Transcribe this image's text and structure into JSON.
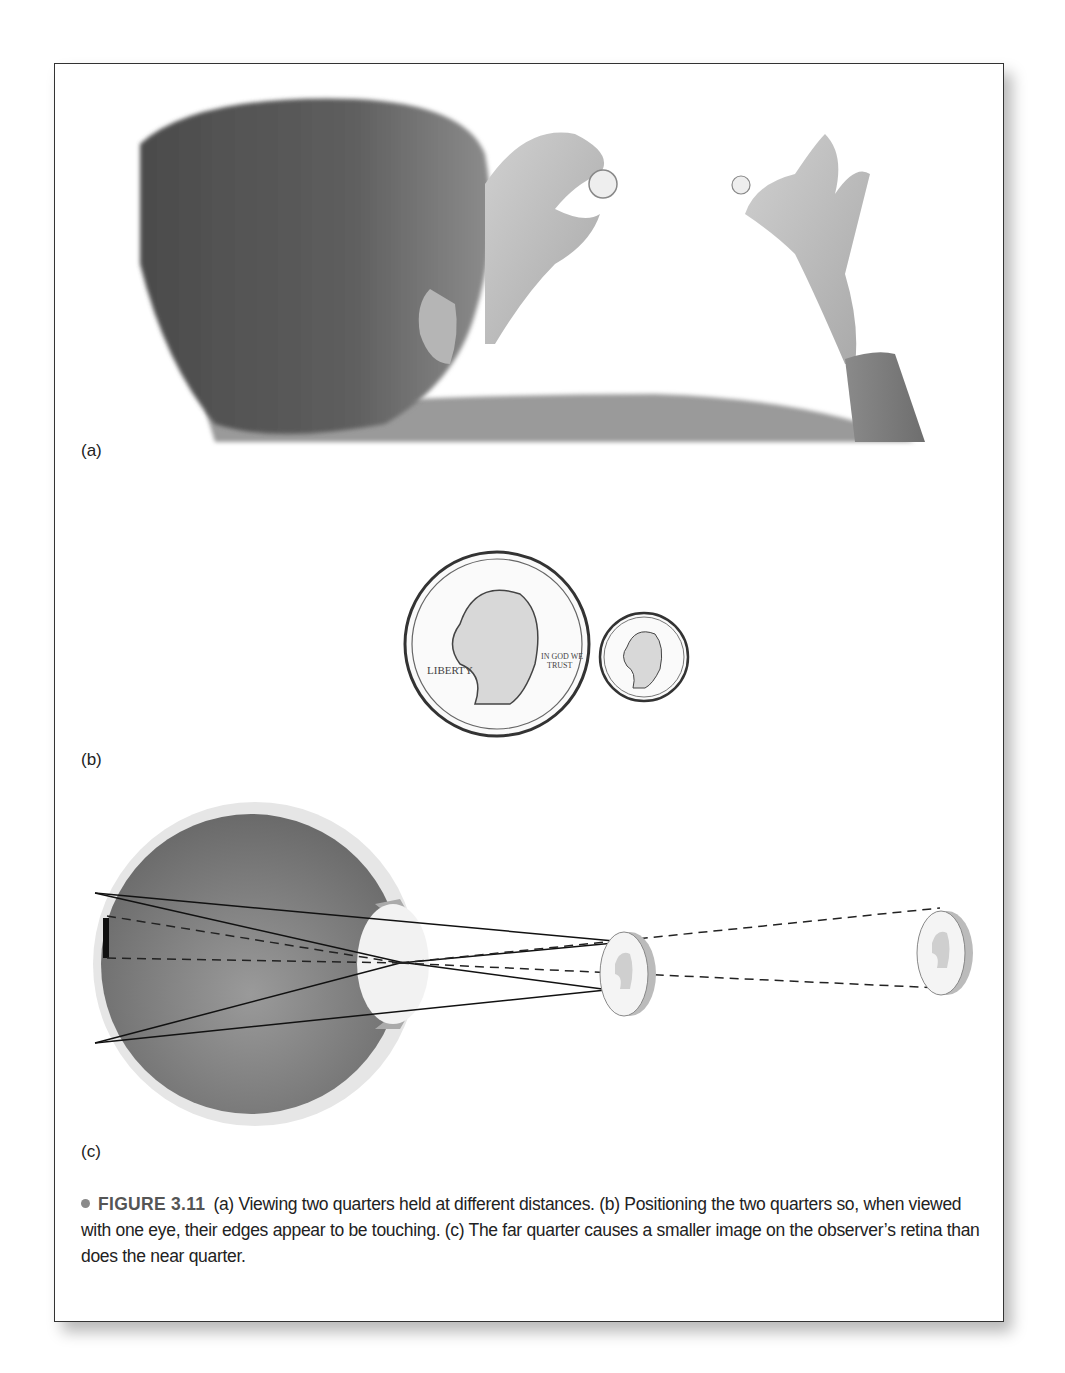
{
  "figure": {
    "panels": [
      {
        "id": "a",
        "label": "(a)",
        "content": "Back of a child's head; one hand holds a quarter close, another hand holds a quarter farther away"
      },
      {
        "id": "b",
        "label": "(b)",
        "content": "Near quarter and far quarter positioned so their edges appear to touch"
      },
      {
        "id": "c",
        "label": "(c)",
        "content": "Eye cross-section with rays from near and far quarters forming retinal images"
      }
    ],
    "coin_text": {
      "top": "UNITED STATES OF AMERICA",
      "left": "LIBERTY",
      "right": "IN GOD WE TRUST",
      "mint": "D",
      "bottom": "QUARTER DOLLAR"
    },
    "caption": {
      "number": "FIGURE 3.11",
      "text": "(a) Viewing two quarters held at different distances. (b) Positioning the two quarters so, when viewed with one eye, their edges appear to be touching. (c) The far quarter causes a smaller image on the observer’s retina than does the near quarter."
    },
    "colors": {
      "border": "#333333",
      "hair": "#5a5a5a",
      "skin": "#bdbdbd",
      "eye_interior": "#7d7d7d",
      "bullet": "#8a8a8a"
    }
  }
}
